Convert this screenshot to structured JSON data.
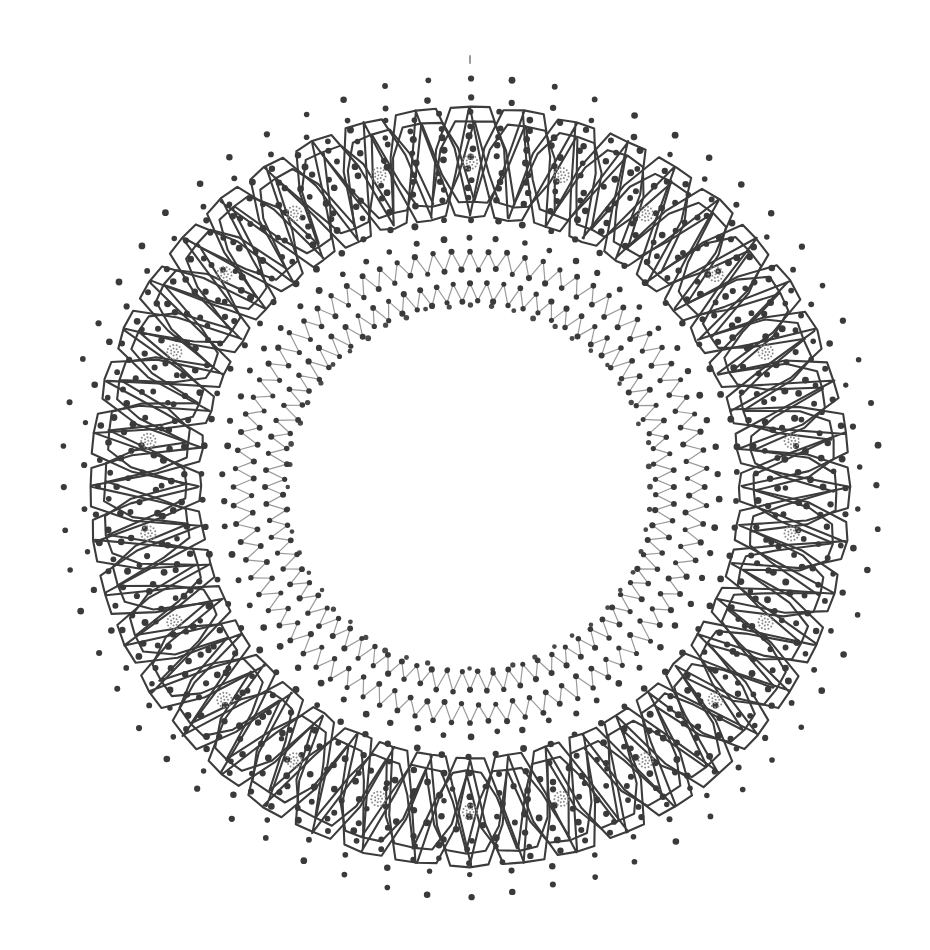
{
  "artwork": {
    "title": "Circular Dotted Mandala Border",
    "type": "ornamental-ring-pattern",
    "canvas": {
      "width": 930,
      "height": 950,
      "background": "#ffffff"
    },
    "center": {
      "x": 470,
      "y": 487
    },
    "palette": {
      "line_dark": "#3c3c3c",
      "line_mid": "#6e6e6e",
      "line_light": "#9a9a9a",
      "dot_dark": "#3a3a3a",
      "dot_mid": "#5a5a5a",
      "rosette": "#8a8a8a",
      "background": "#ffffff"
    },
    "rings": [
      {
        "name": "outer-sparse-dot-ring",
        "kind": "dot-ring",
        "radius": 408,
        "count": 60,
        "dot_radius": 3.1,
        "color": "#3a3a3a"
      },
      {
        "name": "outer-dot-ring-2",
        "kind": "dot-ring",
        "radius": 388,
        "count": 58,
        "dot_radius": 3.0,
        "color": "#3a3a3a"
      },
      {
        "name": "hexagon-chain-outer-path",
        "kind": "interlocking-hexagon-chain",
        "lobes": 22,
        "radius_outer": 382,
        "radius_inner": 268,
        "stroke": "#3c3c3c",
        "stroke_width": 2.1,
        "description": "Two offset interlocking hexagonal loops forming a woven chain"
      },
      {
        "name": "hexagon-chain-inner-path",
        "kind": "interlocking-hexagon-chain",
        "lobes": 22,
        "radius_outer": 368,
        "radius_inner": 282,
        "stroke": "#3c3c3c",
        "stroke_width": 2.1
      },
      {
        "name": "hexagon-center-rosettes",
        "kind": "rosette-cluster-ring",
        "count": 22,
        "radius": 325,
        "cluster_radius": 8,
        "micro_dot_radius": 1.0,
        "color": "#8a8a8a"
      },
      {
        "name": "hexagon-field-dots-a",
        "kind": "dot-ring",
        "radius": 352,
        "count": 80,
        "dot_radius": 3.2,
        "color": "#3a3a3a"
      },
      {
        "name": "hexagon-field-dots-b",
        "kind": "dot-ring",
        "radius": 330,
        "count": 74,
        "dot_radius": 3.2,
        "color": "#3a3a3a"
      },
      {
        "name": "hexagon-field-dots-c",
        "kind": "dot-ring",
        "radius": 308,
        "count": 68,
        "dot_radius": 3.2,
        "color": "#3a3a3a"
      },
      {
        "name": "mid-dot-ring-a",
        "kind": "dot-ring",
        "radius": 288,
        "count": 66,
        "dot_radius": 3.2,
        "color": "#3a3a3a"
      },
      {
        "name": "mid-dot-ring-b",
        "kind": "dot-ring",
        "radius": 268,
        "count": 62,
        "dot_radius": 3.2,
        "color": "#3a3a3a"
      },
      {
        "name": "mid-dot-ring-c",
        "kind": "dot-ring",
        "radius": 248,
        "count": 58,
        "dot_radius": 3.1,
        "color": "#3a3a3a"
      },
      {
        "name": "zigzag-ring-outer",
        "kind": "zigzag-ring",
        "radius_outer": 236,
        "radius_inner": 218,
        "points": 80,
        "stroke": "#9a9a9a",
        "stroke_width": 1.2,
        "vertex_dot_radius": 2.8,
        "vertex_dot_color": "#3a3a3a"
      },
      {
        "name": "zigzag-ring-inner",
        "kind": "zigzag-ring",
        "radius_outer": 204,
        "radius_inner": 186,
        "points": 76,
        "stroke": "#9a9a9a",
        "stroke_width": 1.2,
        "vertex_dot_radius": 2.8,
        "vertex_dot_color": "#3a3a3a"
      },
      {
        "name": "inner-boundary-dot-ring",
        "kind": "dot-ring",
        "radius": 182,
        "count": 52,
        "dot_radius": 2.6,
        "color": "#4a4a4a"
      }
    ],
    "speck": {
      "name": "top-speck-mark",
      "x": 469,
      "y": 55,
      "width": 2,
      "height": 9,
      "color": "#9a9a9a"
    },
    "empty_center": {
      "name": "blank-inner-disc",
      "radius": 178
    }
  }
}
